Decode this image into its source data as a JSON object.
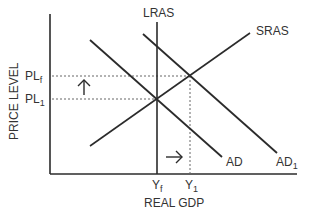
{
  "diagram": {
    "axes": {
      "x_label": "REAL GDP",
      "y_label": "PRICE LEVEL"
    },
    "curves": {
      "lras": {
        "label": "LRAS"
      },
      "sras": {
        "label": "SRAS"
      },
      "ad": {
        "label": "AD"
      },
      "ad1": {
        "label": "AD",
        "sub": "1"
      }
    },
    "price_levels": {
      "plf": {
        "label": "PL",
        "sub": "f"
      },
      "pl1": {
        "label": "PL",
        "sub": "1"
      }
    },
    "output_levels": {
      "yf": {
        "label": "Y",
        "sub": "f"
      },
      "y1": {
        "label": "Y",
        "sub": "1"
      }
    },
    "arrows": {
      "up": "price level rises",
      "right": "output increases"
    },
    "colors": {
      "line": "#2b2b2b",
      "dash": "#666666",
      "text": "#333333"
    }
  }
}
